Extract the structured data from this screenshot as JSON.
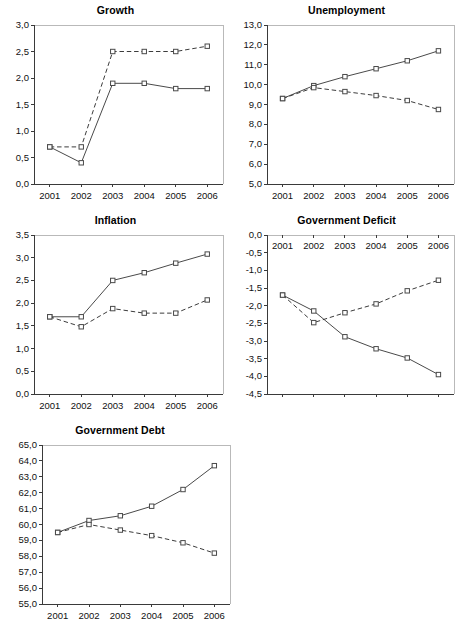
{
  "figure": {
    "marker_shape": "open-square",
    "series_names": [
      "solid",
      "dashed"
    ],
    "categories": [
      "2001",
      "2002",
      "2003",
      "2004",
      "2005",
      "2006"
    ]
  },
  "panels": [
    {
      "key": "growth",
      "title": "Growth",
      "xlabel_position": "bottom",
      "chart_data": {
        "type": "line",
        "title": "Growth",
        "xlabel": "",
        "ylabel": "",
        "categories": [
          "2001",
          "2002",
          "2003",
          "2004",
          "2005",
          "2006"
        ],
        "series": [
          {
            "name": "solid",
            "style": "solid",
            "values": [
              0.7,
              0.4,
              1.9,
              1.9,
              1.8,
              1.8
            ]
          },
          {
            "name": "dashed",
            "style": "dashed",
            "values": [
              0.7,
              0.7,
              2.5,
              2.5,
              2.5,
              2.6
            ]
          }
        ],
        "ylim": [
          0.0,
          3.0
        ],
        "ytick_step": 0.5,
        "yticks": [
          "0,0",
          "0,5",
          "1,0",
          "1,5",
          "2,0",
          "2,5",
          "3,0"
        ],
        "grid": false,
        "legend": "none"
      }
    },
    {
      "key": "unemployment",
      "title": "Unemployment",
      "xlabel_position": "bottom",
      "chart_data": {
        "type": "line",
        "title": "Unemployment",
        "xlabel": "",
        "ylabel": "",
        "categories": [
          "2001",
          "2002",
          "2003",
          "2004",
          "2005",
          "2006"
        ],
        "series": [
          {
            "name": "solid",
            "style": "solid",
            "values": [
              9.3,
              9.95,
              10.4,
              10.8,
              11.2,
              11.7
            ]
          },
          {
            "name": "dashed",
            "style": "dashed",
            "values": [
              9.3,
              9.85,
              9.65,
              9.45,
              9.2,
              8.75
            ]
          }
        ],
        "ylim": [
          5.0,
          13.0
        ],
        "ytick_step": 1.0,
        "yticks": [
          "5,0",
          "6,0",
          "7,0",
          "8,0",
          "9,0",
          "10,0",
          "11,0",
          "12,0",
          "13,0"
        ],
        "grid": false,
        "legend": "none"
      }
    },
    {
      "key": "inflation",
      "title": "Inflation",
      "xlabel_position": "bottom",
      "chart_data": {
        "type": "line",
        "title": "Inflation",
        "xlabel": "",
        "ylabel": "",
        "categories": [
          "2001",
          "2002",
          "2003",
          "2004",
          "2005",
          "2006"
        ],
        "series": [
          {
            "name": "solid",
            "style": "solid",
            "values": [
              1.7,
              1.7,
              2.5,
              2.67,
              2.88,
              3.08
            ]
          },
          {
            "name": "dashed",
            "style": "dashed",
            "values": [
              1.7,
              1.48,
              1.88,
              1.78,
              1.78,
              2.07
            ]
          }
        ],
        "ylim": [
          0.0,
          3.5
        ],
        "ytick_step": 0.5,
        "yticks": [
          "0,0",
          "0,5",
          "1,0",
          "1,5",
          "2,0",
          "2,5",
          "3,0",
          "3,5"
        ],
        "grid": false,
        "legend": "none"
      }
    },
    {
      "key": "government_deficit",
      "title": "Government Deficit",
      "xlabel_position": "top",
      "chart_data": {
        "type": "line",
        "title": "Government Deficit",
        "xlabel": "",
        "ylabel": "",
        "categories": [
          "2001",
          "2002",
          "2003",
          "2004",
          "2005",
          "2006"
        ],
        "series": [
          {
            "name": "solid",
            "style": "solid",
            "values": [
              -1.7,
              -2.15,
              -2.88,
              -3.22,
              -3.48,
              -3.95
            ]
          },
          {
            "name": "dashed",
            "style": "dashed",
            "values": [
              -1.7,
              -2.48,
              -2.2,
              -1.95,
              -1.58,
              -1.28
            ]
          }
        ],
        "ylim": [
          -4.5,
          0.0
        ],
        "ytick_step": 0.5,
        "yticks": [
          "0,0",
          "-0,5",
          "-1,0",
          "-1,5",
          "-2,0",
          "-2,5",
          "-3,0",
          "-3,5",
          "-4,0",
          "-4,5"
        ],
        "grid": false,
        "legend": "none"
      }
    },
    {
      "key": "government_debt",
      "title": "Government Debt",
      "xlabel_position": "bottom",
      "chart_data": {
        "type": "line",
        "title": "Government Debt",
        "xlabel": "",
        "ylabel": "",
        "categories": [
          "2001",
          "2002",
          "2003",
          "2004",
          "2005",
          "2006"
        ],
        "series": [
          {
            "name": "solid",
            "style": "solid",
            "values": [
              59.5,
              60.25,
              60.55,
              61.15,
              62.2,
              63.7
            ]
          },
          {
            "name": "dashed",
            "style": "dashed",
            "values": [
              59.5,
              60.0,
              59.65,
              59.3,
              58.85,
              58.2
            ]
          }
        ],
        "ylim": [
          55.0,
          65.0
        ],
        "ytick_step": 1.0,
        "yticks": [
          "55,0",
          "56,0",
          "57,0",
          "58,0",
          "59,0",
          "60,0",
          "61,0",
          "62,0",
          "63,0",
          "64,0",
          "65,0"
        ],
        "grid": false,
        "legend": "none"
      }
    }
  ]
}
